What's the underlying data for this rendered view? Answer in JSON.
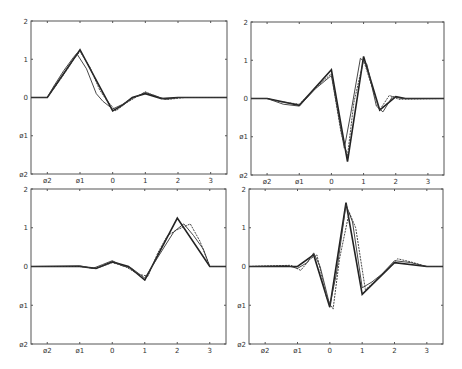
{
  "chart_data": [
    {
      "type": "line",
      "panel": "top-left",
      "title": "",
      "xlabel": "",
      "ylabel": "",
      "xlim": [
        -2.5,
        3.5
      ],
      "ylim": [
        -2,
        2
      ],
      "xticks": [
        "ø2",
        "ø1",
        "0",
        "1",
        "2",
        "3"
      ],
      "yticks": [
        "ø2",
        "ø1",
        "0",
        "1",
        "2"
      ],
      "grid": false,
      "series": [
        {
          "name": "true",
          "x": [
            -2.5,
            -2,
            -1,
            -0.5,
            0,
            0.3,
            0.6,
            1,
            1.5,
            2,
            3.5
          ],
          "y": [
            0,
            0,
            1.25,
            0.45,
            -0.35,
            -0.2,
            0,
            0.1,
            -0.03,
            0,
            0
          ]
        },
        {
          "name": "estimate-1",
          "x": [
            -2.5,
            -2,
            -1.8,
            -1.5,
            -1.2,
            -1.1,
            -0.8,
            -0.5,
            -0.3,
            0,
            0.3,
            0.6,
            1,
            1.3,
            1.6,
            2,
            3.5
          ],
          "y": [
            0,
            0,
            0.3,
            0.7,
            1.05,
            1.15,
            0.75,
            0.1,
            -0.1,
            -0.3,
            -0.18,
            -0.02,
            0.13,
            0.05,
            -0.05,
            0,
            0
          ]
        },
        {
          "name": "estimate-2",
          "x": [
            -2.5,
            -2,
            -1.7,
            -1.4,
            -1.2,
            -1,
            -0.7,
            -0.4,
            -0.2,
            0.1,
            0.4,
            0.7,
            1,
            1.4,
            1.7,
            2.2,
            3.5
          ],
          "y": [
            0,
            0,
            0.35,
            0.72,
            1.0,
            1.2,
            0.8,
            0.2,
            -0.05,
            -0.35,
            -0.15,
            0.0,
            0.15,
            0.0,
            -0.05,
            0,
            0
          ]
        }
      ]
    },
    {
      "type": "line",
      "panel": "top-right",
      "title": "",
      "xlabel": "",
      "ylabel": "",
      "xlim": [
        -2.5,
        3.5
      ],
      "ylim": [
        -2,
        2
      ],
      "xticks": [
        "ø2",
        "ø1",
        "0",
        "1",
        "2",
        "3"
      ],
      "yticks": [
        "ø2",
        "ø1",
        "0",
        "1",
        "2"
      ],
      "grid": false,
      "series": [
        {
          "name": "true",
          "x": [
            -2.5,
            -2,
            -1,
            0,
            0.5,
            1,
            1.5,
            2,
            2.3,
            3.5
          ],
          "y": [
            0,
            0,
            -0.18,
            0.75,
            -1.65,
            1.1,
            -0.3,
            0.05,
            0,
            0
          ]
        },
        {
          "name": "estimate-1",
          "x": [
            -2.5,
            -2,
            -1.5,
            -1,
            -0.5,
            0,
            0.4,
            0.6,
            0.9,
            1.1,
            1.4,
            1.6,
            1.9,
            2.2,
            3.5
          ],
          "y": [
            0,
            0,
            -0.15,
            -0.2,
            0.25,
            0.6,
            -1.3,
            -0.4,
            1.05,
            0.9,
            -0.2,
            -0.35,
            0.05,
            0,
            0
          ]
        },
        {
          "name": "estimate-2",
          "x": [
            -2.5,
            -2,
            -1.6,
            -1,
            -0.4,
            0,
            0.3,
            0.5,
            0.7,
            1,
            1.3,
            1.5,
            1.8,
            2.1,
            3.5
          ],
          "y": [
            0,
            0,
            -0.08,
            -0.15,
            0.35,
            0.65,
            -0.9,
            -1.5,
            -0.1,
            1.0,
            0.2,
            -0.3,
            0.08,
            -0.02,
            0
          ]
        }
      ]
    },
    {
      "type": "line",
      "panel": "bottom-left",
      "title": "",
      "xlabel": "",
      "ylabel": "",
      "xlim": [
        -2.5,
        3.5
      ],
      "ylim": [
        -2,
        2
      ],
      "xticks": [
        "ø2",
        "ø1",
        "0",
        "1",
        "2",
        "3"
      ],
      "yticks": [
        "ø2",
        "ø1",
        "0",
        "1",
        "2"
      ],
      "grid": false,
      "series": [
        {
          "name": "true",
          "x": [
            -2.5,
            -1,
            -0.5,
            0,
            0.5,
            1,
            2,
            3,
            3.5
          ],
          "y": [
            0,
            0,
            -0.05,
            0.12,
            0,
            -0.35,
            1.25,
            0,
            0
          ]
        },
        {
          "name": "estimate-1",
          "x": [
            -2.5,
            -1,
            -0.6,
            -0.3,
            0,
            0.3,
            0.6,
            1,
            1.3,
            1.6,
            1.9,
            2.2,
            2.5,
            2.8,
            3,
            3.5
          ],
          "y": [
            0,
            0.02,
            -0.05,
            0.05,
            0.15,
            0.02,
            -0.05,
            -0.3,
            0.1,
            0.5,
            0.9,
            1.1,
            0.8,
            0.45,
            0,
            0
          ]
        },
        {
          "name": "estimate-2",
          "x": [
            -2.5,
            -1,
            -0.5,
            0,
            0.4,
            0.8,
            1.1,
            1.4,
            1.7,
            2,
            2.4,
            2.7,
            3,
            3.5
          ],
          "y": [
            0,
            0,
            -0.05,
            0.1,
            0.0,
            -0.2,
            -0.25,
            0.35,
            0.8,
            0.95,
            1.1,
            0.65,
            0,
            0
          ]
        }
      ]
    },
    {
      "type": "line",
      "panel": "bottom-right",
      "title": "",
      "xlabel": "",
      "ylabel": "",
      "xlim": [
        -2.5,
        3.5
      ],
      "ylim": [
        -2,
        2
      ],
      "xticks": [
        "ø2",
        "ø1",
        "0",
        "1",
        "2",
        "3"
      ],
      "yticks": [
        "ø2",
        "ø1",
        "0",
        "1",
        "2"
      ],
      "grid": false,
      "series": [
        {
          "name": "true",
          "x": [
            -2.5,
            -1,
            -0.5,
            0,
            0.5,
            1,
            2,
            3,
            3.5
          ],
          "y": [
            0,
            0,
            0.3,
            -1.05,
            1.65,
            -0.72,
            0.1,
            0,
            0
          ]
        },
        {
          "name": "estimate-1",
          "x": [
            -2.5,
            -1.3,
            -1,
            -0.7,
            -0.5,
            -0.3,
            0,
            0.2,
            0.5,
            0.7,
            1,
            1.3,
            1.6,
            2,
            2.5,
            3,
            3.5
          ],
          "y": [
            0,
            0.02,
            -0.05,
            0.1,
            0.35,
            0.0,
            -1.0,
            -0.2,
            1.6,
            1.15,
            -0.55,
            -0.4,
            -0.2,
            0.15,
            0.1,
            0,
            0
          ]
        },
        {
          "name": "estimate-2",
          "x": [
            -2.5,
            -1.2,
            -0.9,
            -0.6,
            -0.4,
            -0.1,
            0.1,
            0.3,
            0.6,
            0.8,
            1.1,
            1.5,
            1.8,
            2.1,
            2.5,
            3,
            3.5
          ],
          "y": [
            0,
            0.03,
            -0.1,
            0.2,
            0.3,
            -0.8,
            -1.1,
            0.2,
            1.4,
            1.0,
            -0.6,
            -0.3,
            -0.05,
            0.2,
            0.12,
            0,
            0
          ]
        }
      ]
    }
  ],
  "panels": [
    {
      "id": "top-left",
      "box": [
        31,
        21,
        227,
        174
      ]
    },
    {
      "id": "top-right",
      "box": [
        251,
        22,
        444,
        175
      ]
    },
    {
      "id": "bottom-left",
      "box": [
        31,
        189,
        226,
        344
      ]
    },
    {
      "id": "bottom-right",
      "box": [
        249,
        189,
        443,
        344
      ]
    }
  ]
}
